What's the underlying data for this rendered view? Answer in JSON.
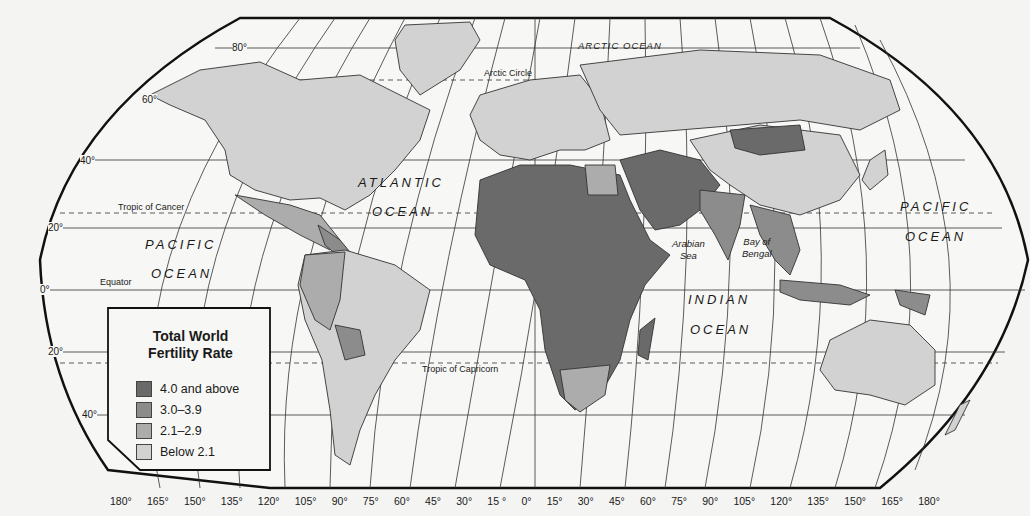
{
  "legend": {
    "title_line1": "Total World",
    "title_line2": "Fertility Rate",
    "items": [
      {
        "label": "4.0 and above",
        "color": "#6a6a6a"
      },
      {
        "label": "3.0–3.9",
        "color": "#8c8c8c"
      },
      {
        "label": "2.1–2.9",
        "color": "#acacac"
      },
      {
        "label": "Below 2.1",
        "color": "#d2d2d2"
      }
    ]
  },
  "oceans": {
    "arctic": "ARCTIC OCEAN",
    "atlantic_1": "ATLANTIC",
    "atlantic_2": "OCEAN",
    "pacific_west_1": "PACIFIC",
    "pacific_west_2": "OCEAN",
    "pacific_east_1": "PACIFIC",
    "pacific_east_2": "OCEAN",
    "indian_1": "INDIAN",
    "indian_2": "OCEAN"
  },
  "seas": {
    "arabian_1": "Arabian",
    "arabian_2": "Sea",
    "bengal_1": "Bay of",
    "bengal_2": "Bengal"
  },
  "lines": {
    "arctic_circle": "Arctic Circle",
    "tropic_cancer": "Tropic of Cancer",
    "equator": "Equator",
    "tropic_capricorn": "Tropic of Capricorn"
  },
  "latitudes": {
    "n80": "80°",
    "n60": "60°",
    "n40": "40°",
    "n20": "20°",
    "eq": "0°",
    "s20": "20°",
    "s40": "40°"
  },
  "longitudes": [
    "180°",
    "165°",
    "150°",
    "135°",
    "120°",
    "105°",
    "90°",
    "75°",
    "60°",
    "45°",
    "30°",
    "15 °",
    "0°",
    "15°",
    "30°",
    "45°",
    "60°",
    "75°",
    "90°",
    "105°",
    "120°",
    "135°",
    "150°",
    "165°",
    "180°"
  ],
  "colors": {
    "background": "#f4f4f2",
    "ocean": "#f7f7f5",
    "high": "#6a6a6a",
    "midhigh": "#8c8c8c",
    "mid": "#acacac",
    "low": "#d2d2d2",
    "border": "#333333"
  }
}
